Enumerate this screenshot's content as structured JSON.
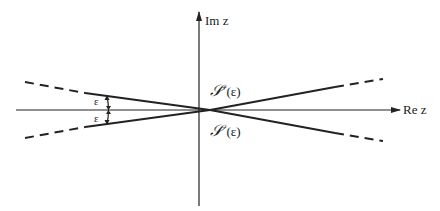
{
  "diagram": {
    "axes": {
      "imaginary_label": "Im z",
      "real_label": "Re z"
    },
    "sectors": [
      {
        "symbol": "𝒮",
        "superscript": "+",
        "argument": "(ε)",
        "position": "upper"
      },
      {
        "symbol": "𝒮",
        "superscript": "−",
        "argument": "(ε)",
        "position": "lower"
      }
    ],
    "angle_labels": {
      "upper": "ε",
      "lower": "ε"
    },
    "colors": {
      "ink": "#222222",
      "background": "#ffffff"
    }
  }
}
